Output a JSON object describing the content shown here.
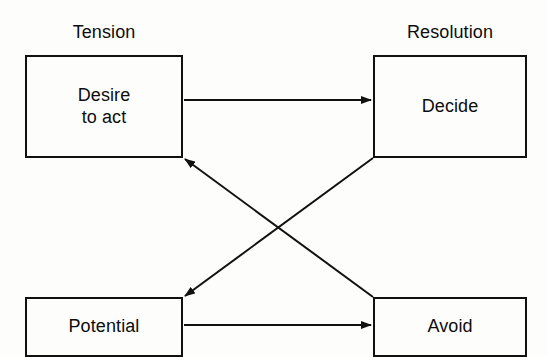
{
  "diagram": {
    "background_color": "#fdfdfc",
    "line_color": "#111111",
    "captions": {
      "tension": "Tension",
      "resolution": "Resolution"
    },
    "nodes": [
      {
        "id": "desire",
        "label": "Desire\nto act",
        "column": "left",
        "row": "top"
      },
      {
        "id": "decide",
        "label": "Decide",
        "column": "right",
        "row": "top"
      },
      {
        "id": "potential",
        "label": "Potential",
        "column": "left",
        "row": "bottom"
      },
      {
        "id": "avoid",
        "label": "Avoid",
        "column": "right",
        "row": "bottom"
      }
    ],
    "arrows": [
      {
        "id": "desire-to-decide",
        "from": "desire",
        "to": "decide",
        "style": "horizontal"
      },
      {
        "id": "potential-to-avoid",
        "from": "potential",
        "to": "avoid",
        "style": "horizontal"
      },
      {
        "id": "decide-to-potential",
        "from": "decide",
        "to": "potential",
        "style": "diagonal"
      },
      {
        "id": "avoid-to-desire",
        "from": "avoid",
        "to": "desire",
        "style": "diagonal"
      }
    ]
  }
}
